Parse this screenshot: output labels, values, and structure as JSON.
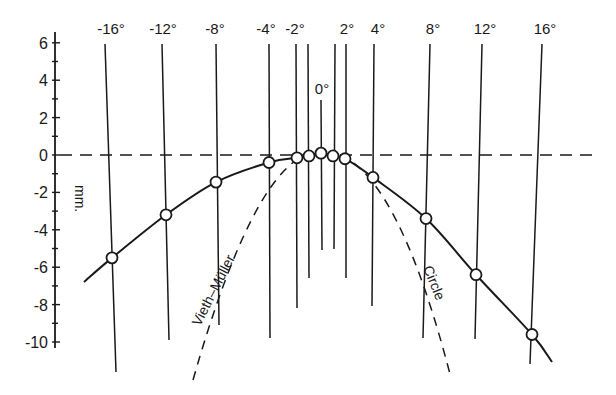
{
  "chart_data": {
    "type": "line",
    "title": "",
    "xlabel": "",
    "ylabel": "mm.",
    "ylim": [
      -11,
      7
    ],
    "yticks": [
      6,
      4,
      2,
      0,
      -2,
      -4,
      -6,
      -8,
      -10
    ],
    "top_labels": [
      "-16°",
      "-12°",
      "-8°",
      "-4°",
      "-2°",
      "0°",
      "2°",
      "4°",
      "8°",
      "12°",
      "16°"
    ],
    "x": [
      -16,
      -12,
      -8,
      -4,
      -2,
      -1,
      0,
      1,
      2,
      4,
      8,
      12,
      16
    ],
    "series": [
      {
        "name": "Measured horopter",
        "style": "solid with open circles",
        "values": [
          -5.5,
          -3.2,
          -1.45,
          -0.4,
          -0.15,
          -0.05,
          0.1,
          -0.05,
          -0.2,
          -1.2,
          -3.4,
          -6.4,
          -9.6
        ]
      }
    ],
    "reference_curves": [
      {
        "name": "Vieth–Müller",
        "label": "Vieth–Müller",
        "style": "dashed"
      },
      {
        "name": "Circle",
        "label": "Circle",
        "style": "dashed"
      }
    ],
    "reference_line": {
      "y": 0,
      "style": "dashed"
    },
    "legend": "none (inline curve labels)",
    "grid": false
  },
  "labels": {
    "ylabel": "mm.",
    "vm_curve": "Vieth–Müller",
    "circle_curve": "Circle",
    "zero": "0°"
  }
}
